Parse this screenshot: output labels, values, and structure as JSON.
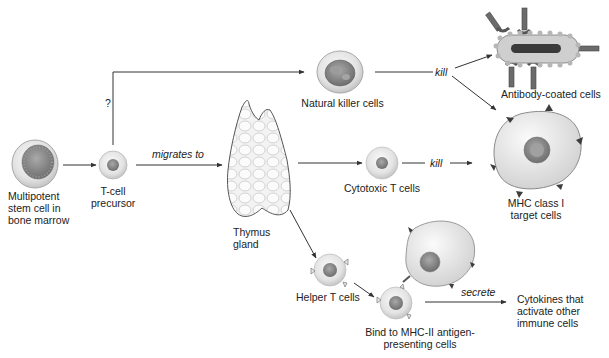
{
  "diagram": {
    "colors": {
      "line": "#333333",
      "cell_fill": "#e6e6e6",
      "cell_edge": "#b5b5b5",
      "nucleus": "#8a8a8a",
      "target_fill": "#e2e2e2",
      "receptor": "#5a5a5a",
      "antibody": "#6b6b6b",
      "bacterium_fill": "#cfcfcf",
      "bacterium_core": "#3a3a3a"
    },
    "nodes": {
      "stem_cell": {
        "label": "Multipotent\nstem cell in\nbone marrow"
      },
      "precursor": {
        "label": "T-cell\nprecursor"
      },
      "thymus": {
        "label": "Thymus\ngland"
      },
      "nk_cells": {
        "label": "Natural killer cells"
      },
      "cytotoxic": {
        "label": "Cytotoxic T cells"
      },
      "helper": {
        "label": "Helper T cells"
      },
      "bind_apc": {
        "label": "Bind to MHC-II antigen-\npresenting cells"
      },
      "antibody_cells": {
        "label": "Antibody-coated cells"
      },
      "mhc1_target": {
        "label": "MHC class I\ntarget cells"
      },
      "cytokines": {
        "label": "Cytokines that\nactivate other\nimmune cells"
      }
    },
    "edges": {
      "question": "?",
      "migrates_to": "migrates to",
      "kill_nk": "kill",
      "kill_cytotoxic": "kill",
      "secrete": "secrete"
    }
  }
}
